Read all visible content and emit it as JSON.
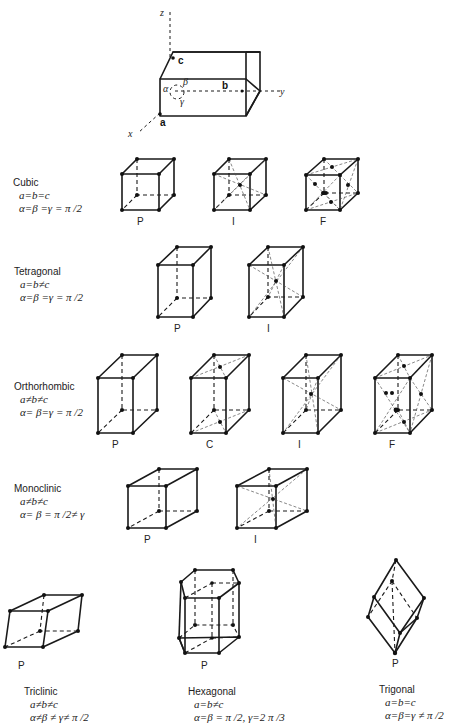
{
  "axes": {
    "x": "x",
    "y": "y",
    "z": "z",
    "a": "a",
    "b": "b",
    "c": "c",
    "alpha": "α",
    "beta": "β",
    "gamma": "γ"
  },
  "systems": [
    {
      "name": "Cubic",
      "eq1": "a=b=c",
      "eq2": "α=β =γ = π /2",
      "lattices": [
        "P",
        "I",
        "F"
      ]
    },
    {
      "name": "Tetragonal",
      "eq1": "a=b≠c",
      "eq2": "α=β =γ = π /2",
      "lattices": [
        "P",
        "I"
      ]
    },
    {
      "name": "Orthorhombic",
      "eq1": "a≠b≠c",
      "eq2": "α= β=γ = π /2",
      "lattices": [
        "P",
        "C",
        "I",
        "F"
      ]
    },
    {
      "name": "Monoclinic",
      "eq1": "a≠b≠c",
      "eq2": "α= β = π /2≠ γ",
      "lattices": [
        "P",
        "I"
      ]
    },
    {
      "name": "Triclinic",
      "eq1": "a≠b≠c",
      "eq2": "α≠β ≠ γ≠ π /2",
      "lattices": [
        "P"
      ]
    },
    {
      "name": "Hexagonal",
      "eq1": "a=b≠c",
      "eq2": "α=β = π /2,  γ=2 π /3",
      "lattices": [
        "P"
      ]
    },
    {
      "name": "Trigonal",
      "eq1": "a=b=c",
      "eq2": "α=β=γ ≠ π /2",
      "lattices": [
        "P"
      ]
    }
  ]
}
